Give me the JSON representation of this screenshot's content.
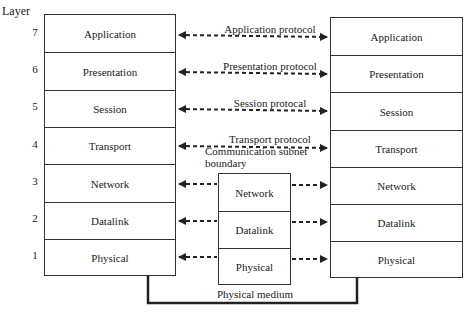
{
  "diagram": {
    "layer_heading": "Layer",
    "layer_numbers": [
      "7",
      "6",
      "5",
      "4",
      "3",
      "2",
      "1"
    ],
    "left_stack": [
      "Application",
      "Presentation",
      "Session",
      "Transport",
      "Network",
      "Datalink",
      "Physical"
    ],
    "right_stack": [
      "Application",
      "Presentation",
      "Session",
      "Transport",
      "Network",
      "Datalink",
      "Physical"
    ],
    "subnet_stack": [
      "Network",
      "Datalink",
      "Physical"
    ],
    "protocols": [
      "Application protocol",
      "Presentation protocol",
      "Session protocal",
      "Transport protocol"
    ],
    "subnet_label_line1": "Communication subnet",
    "subnet_label_line2": "boundary",
    "medium_label": "Physical medium",
    "colors": {
      "line": "#222222",
      "box_border": "#333333",
      "background": "#ffffff"
    }
  }
}
